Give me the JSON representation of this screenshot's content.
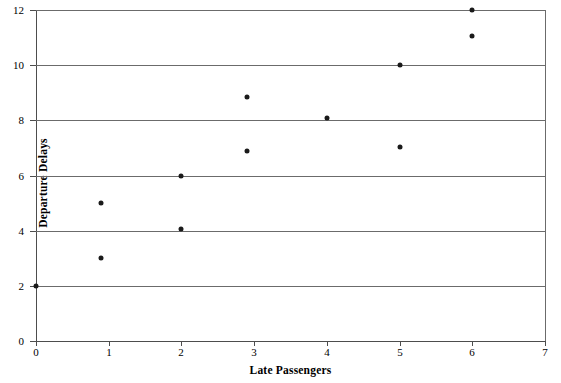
{
  "chart_data": {
    "type": "scatter",
    "title": "",
    "xlabel": "Late Passengers",
    "ylabel": "Departure Delays",
    "xlim": [
      0,
      7
    ],
    "ylim": [
      0,
      12
    ],
    "xticks": [
      0,
      1,
      2,
      3,
      4,
      5,
      6,
      7
    ],
    "yticks": [
      0,
      2,
      4,
      6,
      8,
      10,
      12
    ],
    "xtick_labels": [
      "0",
      "1",
      "2",
      "3",
      "4",
      "5",
      "6",
      "7"
    ],
    "ytick_labels": [
      "0",
      "2",
      "4",
      "6",
      "8",
      "10",
      "12"
    ],
    "grid": "horizontal",
    "legend": "none",
    "marker": "filled-circle",
    "marker_color": "#1a1a1a",
    "points": [
      {
        "x": 0.0,
        "y": 2.0
      },
      {
        "x": 0.9,
        "y": 3.0
      },
      {
        "x": 0.9,
        "y": 5.0
      },
      {
        "x": 2.0,
        "y": 4.05
      },
      {
        "x": 2.0,
        "y": 6.0
      },
      {
        "x": 2.9,
        "y": 6.9
      },
      {
        "x": 2.9,
        "y": 8.85
      },
      {
        "x": 4.0,
        "y": 8.1
      },
      {
        "x": 5.0,
        "y": 7.05
      },
      {
        "x": 5.0,
        "y": 10.0
      },
      {
        "x": 6.0,
        "y": 11.05
      },
      {
        "x": 6.0,
        "y": 12.0
      }
    ]
  },
  "axes": {
    "y_title": "Departure Delays",
    "x_title": "Late Passengers"
  }
}
